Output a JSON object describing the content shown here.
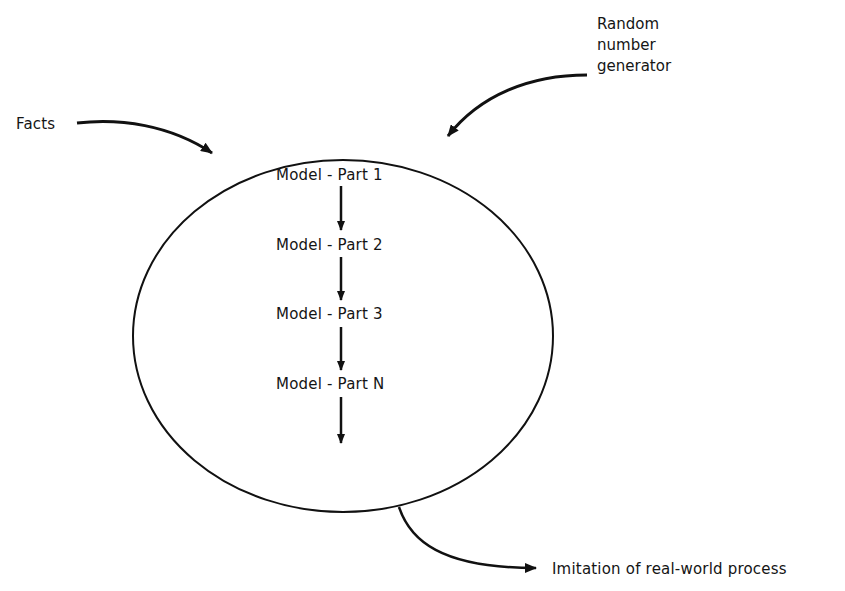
{
  "diagram": {
    "inputs": {
      "facts": "Facts",
      "random_number_generator": [
        "Random",
        "number",
        "generator"
      ]
    },
    "model_parts": [
      "Model - Part 1",
      "Model - Part 2",
      "Model - Part 3",
      "Model - Part N"
    ],
    "output": "Imitation of real-world process"
  }
}
